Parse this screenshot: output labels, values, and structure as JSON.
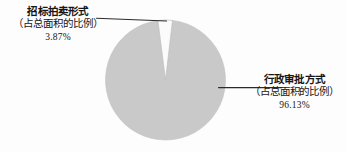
{
  "chart_data": {
    "type": "pie",
    "title": "",
    "categories": [
      "招标拍卖形式（占总面积的比例）",
      "行政审批方式（占总面积的比例）"
    ],
    "values": [
      3.87,
      96.13
    ],
    "value_labels": [
      "3.87%",
      "96.13%"
    ],
    "unit": "%",
    "legend_position": "callout-labels",
    "grid": false,
    "colors": [
      "#fbfbfb",
      "#c9c9c9"
    ],
    "slices": [
      {
        "name": "招标拍卖形式",
        "sub": "（占总面积的比例）",
        "percent_label": "3.87%",
        "value": 3.87,
        "color": "#fbfbfb",
        "callout_side": "left"
      },
      {
        "name": "行政审批方式",
        "sub": "（占总面积的比例）",
        "percent_label": "96.13%",
        "value": 96.13,
        "color": "#c9c9c9",
        "callout_side": "right"
      }
    ]
  },
  "callouts": {
    "left": {
      "name": "招标拍卖形式",
      "sub": "（占总面积的比例）",
      "percent": "3.87%"
    },
    "right": {
      "name": "行政审批方式",
      "sub": "（占总面积的比例）",
      "percent": "96.13%"
    }
  },
  "style": {
    "slice_major_color": "#c9c9c9",
    "slice_minor_color": "#fbfbfb",
    "slice_outline_color": "#b4b4b4",
    "leader_line_color": "#2b2b2b",
    "background_color": "#fdfdfd",
    "text_color": "#161616"
  }
}
